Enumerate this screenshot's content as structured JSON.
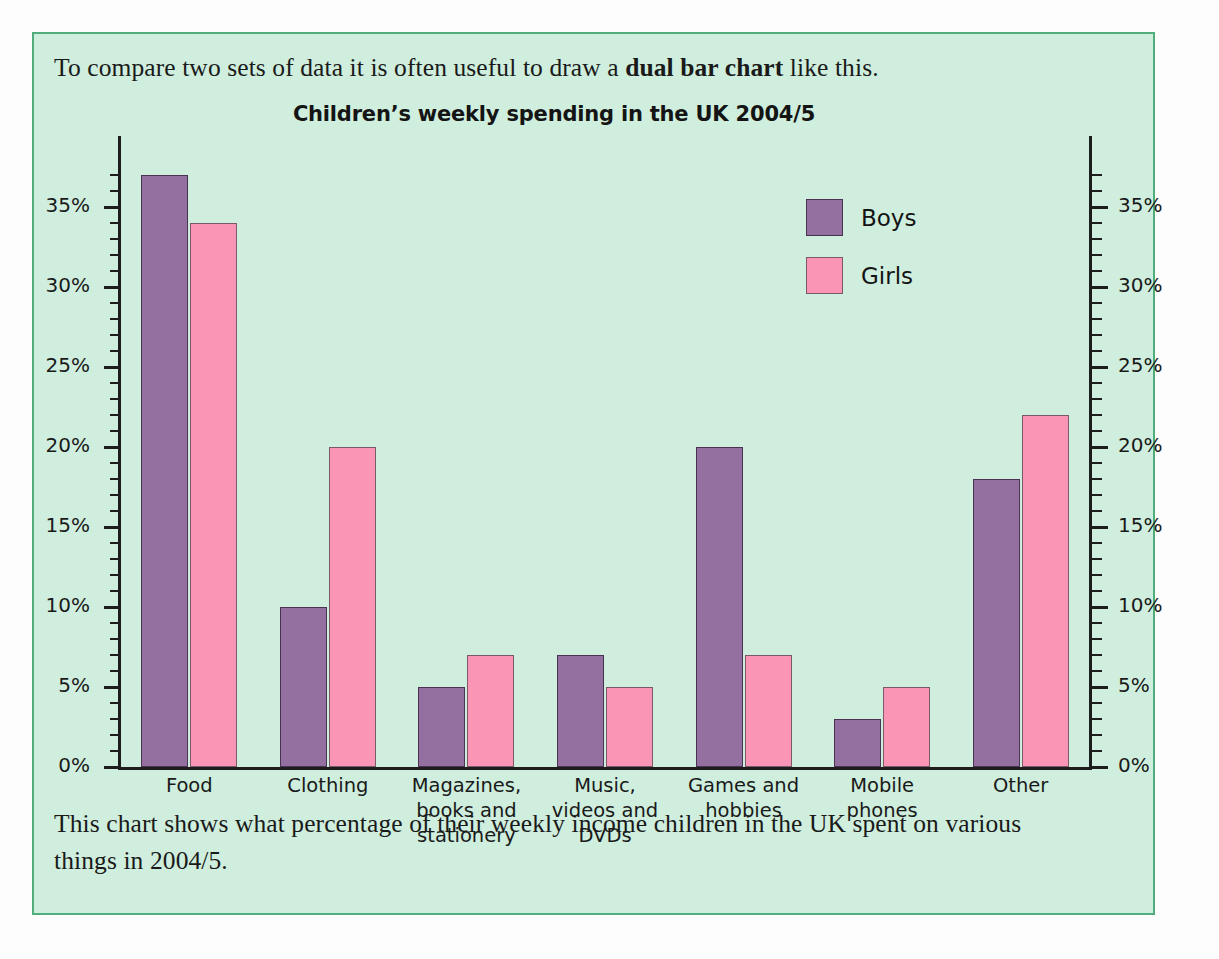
{
  "intro_text_prefix": "To compare two sets of data it is often useful to draw a ",
  "intro_text_bold": "dual bar chart",
  "intro_text_suffix": " like this.",
  "outro_text": "This chart shows what percentage of their weekly income children in the UK spent on various things in 2004/5.",
  "colors": {
    "panel_background": "#cfeedd",
    "panel_border": "#4fae7c",
    "boys": "#9370a0",
    "girls": "#fb95b6",
    "axis": "#1d1d1d",
    "text": "#1a1a1a"
  },
  "legend": {
    "items": [
      {
        "label": "Boys",
        "color": "#9370a0"
      },
      {
        "label": "Girls",
        "color": "#fb95b6"
      }
    ]
  },
  "chart_data": {
    "type": "bar",
    "title": "Children’s weekly spending in the UK 2004/5",
    "xlabel": "",
    "ylabel": "",
    "ylim": [
      0,
      38
    ],
    "grid": false,
    "legend_position": "top-right",
    "dual_axis": true,
    "ytick_labels": [
      "0%",
      "5%",
      "10%",
      "15%",
      "20%",
      "25%",
      "30%",
      "35%"
    ],
    "ytick_values": [
      0,
      5,
      10,
      15,
      20,
      25,
      30,
      35
    ],
    "minor_tick_step": 1,
    "categories": [
      "Food",
      "Clothing",
      "Magazines, books and stationery",
      "Music, videos and DVDs",
      "Games and hobbies",
      "Mobile phones",
      "Other"
    ],
    "category_label_lines": [
      [
        "Food"
      ],
      [
        "Clothing"
      ],
      [
        "Magazines,",
        "books and",
        "stationery"
      ],
      [
        "Music,",
        "videos and",
        "DVDs"
      ],
      [
        "Games and",
        "hobbies"
      ],
      [
        "Mobile",
        "phones"
      ],
      [
        "Other"
      ]
    ],
    "series": [
      {
        "name": "Boys",
        "color": "#9370a0",
        "values": [
          37,
          10,
          5,
          7,
          20,
          3,
          18
        ]
      },
      {
        "name": "Girls",
        "color": "#fb95b6",
        "values": [
          34,
          20,
          7,
          5,
          7,
          5,
          22
        ]
      }
    ]
  }
}
